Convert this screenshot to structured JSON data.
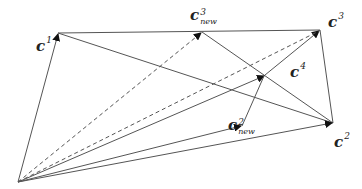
{
  "diagram": {
    "type": "vector-diagram",
    "origin": {
      "x": 18,
      "y": 182
    },
    "points": {
      "c1": {
        "x": 58,
        "y": 33,
        "label": "c",
        "sup": "1"
      },
      "c3new": {
        "x": 202,
        "y": 32,
        "label": "c",
        "sup": "3",
        "sub": "new"
      },
      "c3": {
        "x": 320,
        "y": 30,
        "label": "c",
        "sup": "3"
      },
      "c4": {
        "x": 265,
        "y": 75,
        "label": "c",
        "sup": "4"
      },
      "c2new": {
        "x": 242,
        "y": 126,
        "label": "c",
        "sup": "2",
        "sub": "new"
      },
      "c2": {
        "x": 333,
        "y": 123,
        "label": "c",
        "sup": "2"
      }
    },
    "line_color": "#555555",
    "arrow_color": "#111111"
  }
}
